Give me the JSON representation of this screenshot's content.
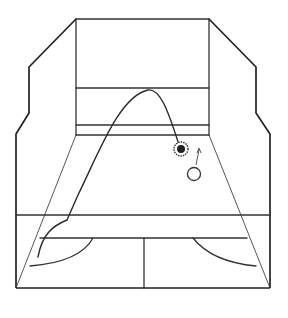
{
  "diagram": {
    "type": "squash-court-perspective",
    "colors": {
      "line": "#333333",
      "ball_filled": "#222222",
      "background": "#ffffff"
    },
    "elements": {
      "front_wall": "front-wall",
      "service_line": "service-line",
      "tin_top": "tin-top",
      "tin_bottom": "tin-bottom",
      "short_line": "short-line",
      "half_court_line": "half-court-line",
      "service_boxes": [
        "left-service-box-arc",
        "right-service-box-arc"
      ],
      "ball_start": "ball-hit-marker",
      "ball_end": "ball-outline",
      "arrow": "movement-arrow"
    }
  }
}
